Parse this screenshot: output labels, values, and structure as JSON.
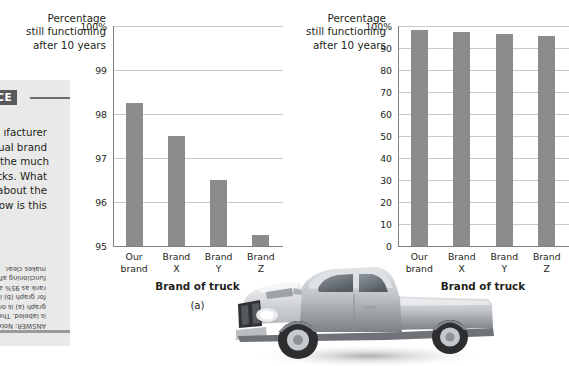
{
  "sidebar": {
    "badge_label": "TICE",
    "body_lines": [
      "ıfacturer",
      "ctual brand",
      "est the much",
      "rucks. What",
      "ır about the",
      "ow is this"
    ],
    "answer_lines": [
      "ANSWER: Note",
      "is labeled. The",
      "graph (a) is on",
      "for graph (b) is",
      "rank as 95% an",
      "functioning aft",
      "makes clear."
    ]
  },
  "chart_data": [
    {
      "type": "bar",
      "panel": "(a)",
      "title": "",
      "ylabel": "Percentage still functioning after 10 years",
      "ylabel_lines": [
        "Percentage",
        "still functioning",
        "after 10 years"
      ],
      "xlabel": "Brand of truck",
      "categories": [
        "Our brand",
        "Brand X",
        "Brand Y",
        "Brand Z"
      ],
      "category_lines": [
        [
          "Our",
          "brand"
        ],
        [
          "Brand",
          "X"
        ],
        [
          "Brand",
          "Y"
        ],
        [
          "Brand",
          "Z"
        ]
      ],
      "values": [
        98.25,
        97.5,
        96.5,
        95.25
      ],
      "ylim": [
        95,
        100
      ],
      "yticks": [
        95,
        96,
        97,
        98,
        99,
        100
      ],
      "ytick_labels": [
        "95",
        "96",
        "97",
        "98",
        "99",
        "100%"
      ],
      "grid": true,
      "legend": "none",
      "bar_color": "#8c8c8c"
    },
    {
      "type": "bar",
      "panel": "(b)",
      "title": "",
      "ylabel": "Percentage still functioning after 10 years",
      "ylabel_lines": [
        "Percentage",
        "still functioning",
        "after 10 years"
      ],
      "xlabel": "Brand of truck",
      "categories": [
        "Our brand",
        "Brand X",
        "Brand Y",
        "Brand Z"
      ],
      "category_lines": [
        [
          "Our",
          "brand"
        ],
        [
          "Brand",
          "X"
        ],
        [
          "Brand",
          "Y"
        ],
        [
          "Brand",
          "Z"
        ]
      ],
      "values": [
        98.25,
        97.5,
        96.5,
        95.25
      ],
      "ylim": [
        0,
        100
      ],
      "yticks": [
        0,
        10,
        20,
        30,
        40,
        50,
        60,
        70,
        80,
        90,
        100
      ],
      "ytick_labels": [
        "0",
        "10",
        "20",
        "30",
        "40",
        "50",
        "60",
        "70",
        "80",
        "90",
        "100%"
      ],
      "grid": true,
      "legend": "none",
      "bar_color": "#8c8c8c"
    }
  ],
  "photo": {
    "caption": "pickup-truck-photograph",
    "body_color": "#b9bcc0",
    "shadow_color": "#3a3a3c"
  }
}
